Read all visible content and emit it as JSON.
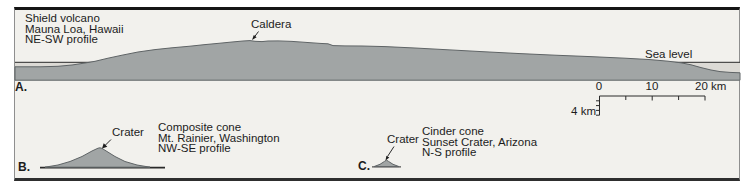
{
  "figure": {
    "panel_a": {
      "label": "A.",
      "caption_lines": [
        "Shield volcano",
        "Mauna Loa, Hawaii",
        "NE-SW profile"
      ],
      "caldera_label": "Caldera",
      "sea_level_label": "Sea level"
    },
    "scale_bar": {
      "tick_0": "0",
      "tick_10": "10",
      "tick_20": "20 km",
      "vertical_label": "4 km"
    },
    "panel_b": {
      "label": "B.",
      "crater_label": "Crater",
      "caption_lines": [
        "Composite cone",
        "Mt. Rainier, Washington",
        "NW-SE profile"
      ]
    },
    "panel_c": {
      "label": "C.",
      "crater_label": "Crater",
      "caption_lines": [
        "Cinder cone",
        "Sunset Crater, Arizona",
        "N-S profile"
      ]
    },
    "colors": {
      "volcano_fill": "#a1a5a5",
      "volcano_outline": "#5f6466",
      "sea_fill": "#dcdad5",
      "panel_background": "#f2f1ed"
    }
  }
}
